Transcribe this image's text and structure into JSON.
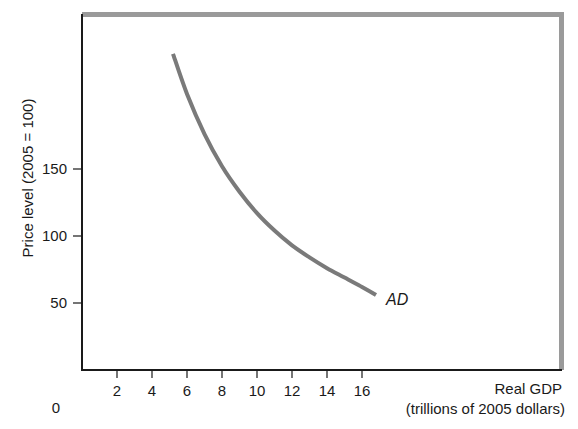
{
  "chart_data": {
    "type": "line",
    "title": "",
    "xlabel": "Real GDP",
    "xlabel_sub": "(trillions of 2005 dollars)",
    "ylabel": "Price level (2005 = 100)",
    "origin_label": "0",
    "x_ticks": [
      2,
      4,
      6,
      8,
      10,
      12,
      14,
      16
    ],
    "y_ticks": [
      50,
      100,
      150
    ],
    "xlim": [
      0,
      27.5
    ],
    "ylim": [
      0,
      265
    ],
    "grid": false,
    "legend": "none",
    "series": [
      {
        "name": "AD",
        "label": "AD",
        "color": "#7a7a7a",
        "x": [
          5.2,
          6.0,
          7.0,
          8.0,
          9.0,
          10.0,
          11.0,
          12.0,
          13.0,
          14.0,
          15.0,
          16.0,
          16.8
        ],
        "y": [
          236,
          206,
          176,
          152,
          133,
          117,
          104,
          93,
          84,
          76,
          69,
          62,
          56
        ]
      }
    ]
  },
  "colors": {
    "axis": "#1a1a1a",
    "frame": "#9a9a9a",
    "curve": "#7a7a7a"
  }
}
